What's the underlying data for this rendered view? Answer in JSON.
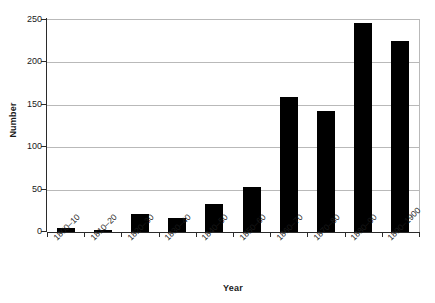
{
  "chart_data": {
    "type": "bar",
    "title": "",
    "subtitle": "",
    "xlabel": "Year",
    "ylabel": "Number",
    "categories": [
      "1800–10",
      "1810–20",
      "1820–30",
      "1830–40",
      "1840–50",
      "1850–60",
      "1860–70",
      "1870–80",
      "1880–90",
      "1890–1900"
    ],
    "values": [
      5,
      2,
      21,
      16,
      33,
      53,
      159,
      143,
      247,
      225
    ],
    "ylim": [
      0,
      250
    ],
    "yticks": [
      0,
      50,
      100,
      150,
      200,
      250
    ],
    "ytick_labels": [
      "0",
      "50",
      "100",
      "150",
      "200",
      "250"
    ],
    "grid": true,
    "grid_axis": "y",
    "legend": false,
    "legend_position": "none",
    "bar_color": "#000000",
    "grid_color": "#b9b9b9",
    "axis_color": "#2b2b2b",
    "background_color": "#ffffff",
    "x_tick_label_rotation": -45
  }
}
